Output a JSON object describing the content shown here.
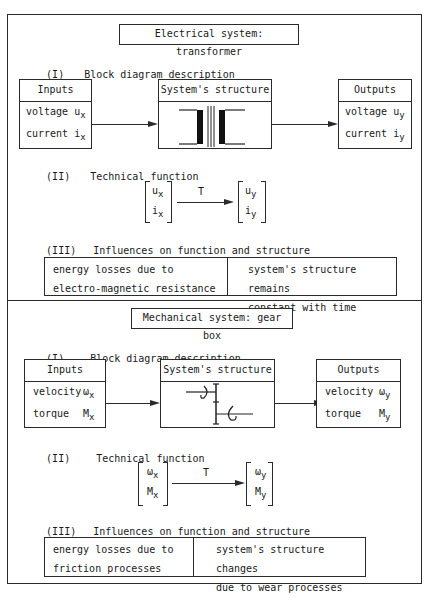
{
  "sections": [
    {
      "title": "Electrical system: transformer",
      "block_heading": {
        "num": "(I)",
        "label": "Block diagram description"
      },
      "inputs": {
        "header": "Inputs",
        "rows": [
          {
            "label": "voltage",
            "sym": "u",
            "sub": "x"
          },
          {
            "label": "current",
            "sym": "i",
            "sub": "x"
          }
        ]
      },
      "structure": {
        "header": "System's structure",
        "icon": "transformer-icon"
      },
      "outputs": {
        "header": "Outputs",
        "rows": [
          {
            "label": "voltage",
            "sym": "u",
            "sub": "y"
          },
          {
            "label": "current",
            "sym": "i",
            "sub": "y"
          }
        ]
      },
      "function_heading": {
        "num": "(II)",
        "label": "Technical function"
      },
      "function": {
        "in": [
          {
            "sym": "u",
            "sub": "x"
          },
          {
            "sym": "i",
            "sub": "x"
          }
        ],
        "op": "T",
        "out": [
          {
            "sym": "u",
            "sub": "y"
          },
          {
            "sym": "i",
            "sub": "y"
          }
        ]
      },
      "influence_heading": {
        "num": "(III)",
        "label": "Influences on function and structure"
      },
      "influences": [
        [
          "energy losses due to",
          "electro-magnetic resistance"
        ],
        [
          "system's structure remains",
          "constant with time"
        ]
      ]
    },
    {
      "title": "Mechanical system: gear box",
      "block_heading": {
        "num": "(I)",
        "label": "Block diagram description"
      },
      "inputs": {
        "header": "Inputs",
        "rows": [
          {
            "label": "velocity",
            "sym": "ω",
            "sub": "x"
          },
          {
            "label": "torque",
            "sym": "M",
            "sub": "x"
          }
        ]
      },
      "structure": {
        "header": "System's structure",
        "icon": "gearbox-icon"
      },
      "outputs": {
        "header": "Outputs",
        "rows": [
          {
            "label": "velocity",
            "sym": "ω",
            "sub": "y"
          },
          {
            "label": "torque",
            "sym": "M",
            "sub": "y"
          }
        ]
      },
      "function_heading": {
        "num": "(II)",
        "label": "Technical function"
      },
      "function": {
        "in": [
          {
            "sym": "ω",
            "sub": "x"
          },
          {
            "sym": "M",
            "sub": "x"
          }
        ],
        "op": "T",
        "out": [
          {
            "sym": "ω",
            "sub": "y"
          },
          {
            "sym": "M",
            "sub": "y"
          }
        ]
      },
      "influence_heading": {
        "num": "(III)",
        "label": "Influences on function and structure"
      },
      "influences": [
        [
          "energy losses due to",
          "friction processes"
        ],
        [
          "system's structure changes",
          "due to wear processes"
        ]
      ]
    }
  ]
}
